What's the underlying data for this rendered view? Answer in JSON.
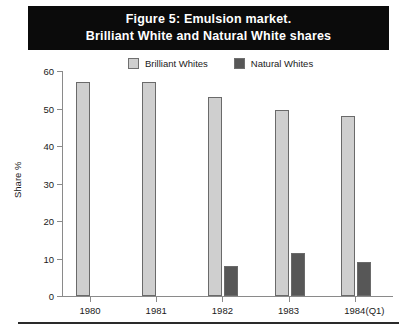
{
  "figure": {
    "title_lines": [
      "Figure 5: Emulsion market.",
      "Brilliant White and Natural White shares"
    ],
    "x_annotation": "(Q1)"
  },
  "colors": {
    "brilliant": "#cfcfcf",
    "natural": "#575757",
    "banner_bg": "#0b0b0b",
    "banner_text": "#ffffff",
    "axis": "#8a8a8a",
    "rule": "#2a2a2a"
  },
  "chart_data": {
    "type": "bar",
    "title": "Figure 5: Emulsion market. Brilliant White and Natural White shares",
    "xlabel": "",
    "ylabel": "Share %",
    "ylim": [
      0,
      60
    ],
    "yticks": [
      0,
      10,
      20,
      30,
      40,
      50,
      60
    ],
    "grid": false,
    "legend_position": "top",
    "categories": [
      "1980",
      "1981",
      "1982",
      "1983",
      "1984"
    ],
    "series": [
      {
        "name": "Brilliant Whites",
        "color": "#cfcfcf",
        "values": [
          57,
          57,
          53,
          49.5,
          48
        ]
      },
      {
        "name": "Natural Whites",
        "color": "#575757",
        "values": [
          null,
          null,
          8,
          11.5,
          9
        ]
      }
    ],
    "annotations": [
      "(Q1)"
    ]
  }
}
